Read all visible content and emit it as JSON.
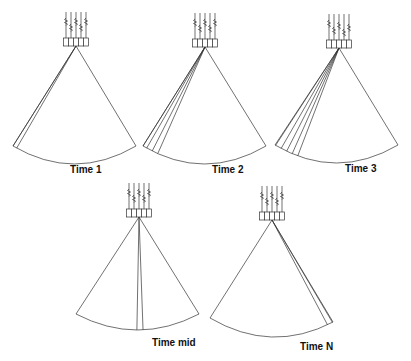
{
  "panels": [
    {
      "label": "Time 1",
      "apex": [
        76,
        46
      ],
      "left": [
        13,
        146
      ],
      "right": [
        136,
        146
      ],
      "arc_depth": 18,
      "beams": [
        -33,
        -30
      ],
      "label_pos": [
        70,
        173
      ]
    },
    {
      "label": "Time 2",
      "apex": [
        205,
        47
      ],
      "left": [
        143,
        146
      ],
      "right": [
        266,
        146
      ],
      "arc_depth": 18,
      "beams": [
        -33,
        -30,
        -27,
        -24
      ],
      "label_pos": [
        212,
        173
      ]
    },
    {
      "label": "Time 3",
      "apex": [
        339,
        48
      ],
      "left": [
        275,
        145
      ],
      "right": [
        398,
        145
      ],
      "arc_depth": 18,
      "beams": [
        -33,
        -30,
        -27,
        -24,
        -21
      ],
      "label_pos": [
        345,
        172
      ]
    },
    {
      "label": "Time mid",
      "apex": [
        139,
        217
      ],
      "left": [
        76,
        314
      ],
      "right": [
        199,
        314
      ],
      "arc_depth": 16,
      "beams": [
        -1,
        2
      ],
      "label_pos": [
        152,
        346
      ]
    },
    {
      "label": "Time N",
      "apex": [
        272,
        220
      ],
      "left": [
        210,
        318
      ],
      "right": [
        333,
        322
      ],
      "arc_depth": 16,
      "beams": [
        28,
        31
      ],
      "label_pos": [
        300,
        350
      ]
    }
  ],
  "transducer": {
    "elements": 5,
    "element_width": 5,
    "element_height": 8
  }
}
